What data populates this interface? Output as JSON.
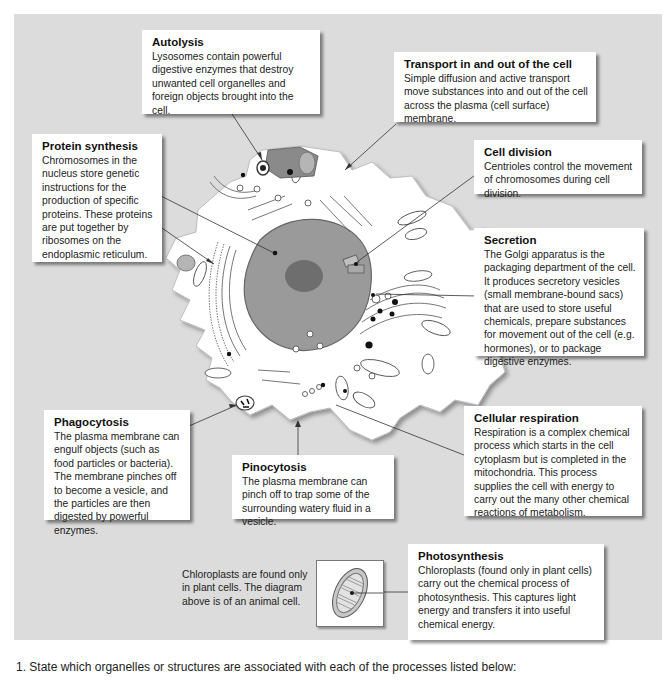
{
  "boxes": {
    "autolysis": {
      "title": "Autolysis",
      "text": "Lysosomes contain powerful digestive enzymes that destroy unwanted cell organelles and foreign objects brought into the cell."
    },
    "transport": {
      "title": "Transport in and out of the cell",
      "text": "Simple diffusion and active transport move substances into and out of the cell across the plasma (cell surface) membrane."
    },
    "protein_synthesis": {
      "title": "Protein synthesis",
      "text": "Chromosomes in the nucleus store genetic instructions for the production of specific proteins. These proteins are put together by ribosomes on the endoplasmic reticulum."
    },
    "cell_division": {
      "title": "Cell division",
      "text": "Centrioles control the movement of chromosomes during cell division."
    },
    "secretion": {
      "title": "Secretion",
      "text": "The Golgi apparatus is the packaging department of the cell. It produces secretory vesicles (small membrane-bound sacs) that are used to store useful chemicals, prepare substances for movement out of the cell (e.g. hormones), or to package digestive enzymes."
    },
    "phagocytosis": {
      "title": "Phagocytosis",
      "text": "The plasma membrane can engulf objects (such as food particles or bacteria). The membrane pinches off to become a vesicle, and the particles are then digested by powerful enzymes."
    },
    "pinocytosis": {
      "title": "Pinocytosis",
      "text": "The plasma membrane can pinch off to trap some of the surrounding watery fluid in a vesicle."
    },
    "cellular_respiration": {
      "title": "Cellular respiration",
      "text": "Respiration is a complex chemical process which starts in the cell cytoplasm but is completed in the mitochondria. This process supplies the cell with energy to carry out the many other chemical reactions of metabolism."
    },
    "photosynthesis": {
      "title": "Photosynthesis",
      "text": "Chloroplasts (found only in plant cells) carry out the chemical process of photosynthesis. This captures light energy and transfers it into useful chemical energy."
    }
  },
  "note": "Chloroplasts are found only in plant cells. The diagram above is of an animal cell.",
  "question": "1.  State which organelles or structures are associated with each of the processes listed below:",
  "colors": {
    "panel_bg": "#dcdcdc",
    "box_bg": "#ffffff",
    "cell_fill": "#ffffff",
    "nucleus": "#9a9a9a",
    "nucleolus": "#6e6e6e",
    "organelle_grey": "#b0b0b0"
  }
}
